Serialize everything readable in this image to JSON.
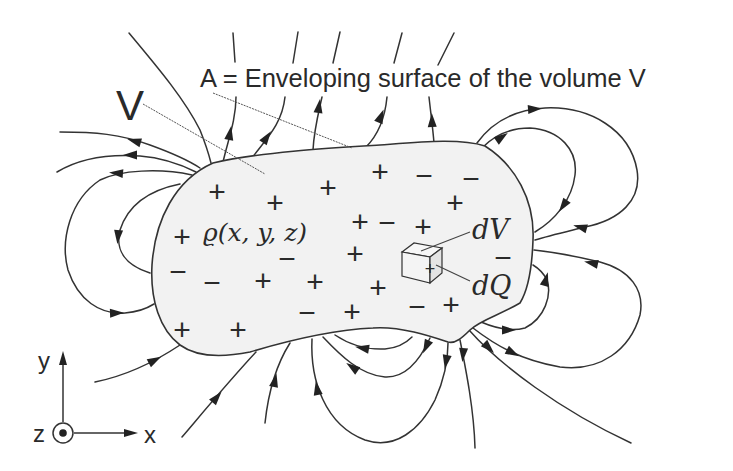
{
  "labels": {
    "surface_label": "A = Enveloping surface of the volume V",
    "volume_label": "V",
    "density_label": "ϱ(x, y, z)",
    "volume_element_label": "dV",
    "charge_element_label": "dQ",
    "cube_charge": "+"
  },
  "axes": {
    "x_label": "x",
    "y_label": "y",
    "z_label": "z",
    "z_symbol": "out-of-page (dot in circle)"
  },
  "colors": {
    "background": "#ffffff",
    "volume_fill": "#f2f2f2",
    "line": "#333333",
    "text": "#2a2a2a"
  },
  "charges": [
    {
      "sign": "+",
      "x": 217,
      "y": 192
    },
    {
      "sign": "+",
      "x": 275,
      "y": 203
    },
    {
      "sign": "+",
      "x": 328,
      "y": 188
    },
    {
      "sign": "+",
      "x": 380,
      "y": 172
    },
    {
      "sign": "−",
      "x": 424,
      "y": 176
    },
    {
      "sign": "−",
      "x": 471,
      "y": 179
    },
    {
      "sign": "+",
      "x": 455,
      "y": 203
    },
    {
      "sign": "+",
      "x": 182,
      "y": 237
    },
    {
      "sign": "+",
      "x": 360,
      "y": 222
    },
    {
      "sign": "−",
      "x": 387,
      "y": 223
    },
    {
      "sign": "+",
      "x": 423,
      "y": 227
    },
    {
      "sign": "−",
      "x": 287,
      "y": 259
    },
    {
      "sign": "+",
      "x": 355,
      "y": 254
    },
    {
      "sign": "−",
      "x": 503,
      "y": 258
    },
    {
      "sign": "−",
      "x": 178,
      "y": 272
    },
    {
      "sign": "−",
      "x": 212,
      "y": 283
    },
    {
      "sign": "+",
      "x": 263,
      "y": 281
    },
    {
      "sign": "+",
      "x": 315,
      "y": 282
    },
    {
      "sign": "+",
      "x": 378,
      "y": 288
    },
    {
      "sign": "−",
      "x": 307,
      "y": 313
    },
    {
      "sign": "+",
      "x": 352,
      "y": 312
    },
    {
      "sign": "−",
      "x": 417,
      "y": 307
    },
    {
      "sign": "+",
      "x": 451,
      "y": 305
    },
    {
      "sign": "+",
      "x": 182,
      "y": 330
    },
    {
      "sign": "+",
      "x": 238,
      "y": 330
    }
  ]
}
